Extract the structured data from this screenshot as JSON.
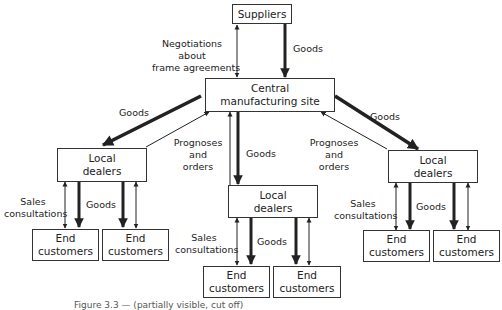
{
  "diagram": {
    "nodes": {
      "suppliers": "Suppliers",
      "central": [
        "Central",
        "manufacturing site"
      ],
      "dealer_left": [
        "Local",
        "dealers"
      ],
      "dealer_mid": [
        "Local",
        "dealers"
      ],
      "dealer_right": [
        "Local",
        "dealers"
      ],
      "end_customers": [
        "End",
        "customers"
      ]
    },
    "edge_labels": {
      "negotiations": [
        "Negotiations",
        "about",
        "frame agreements"
      ],
      "goods": "Goods",
      "prognoses": [
        "Prognoses",
        "and",
        "orders"
      ],
      "sales": [
        "Sales",
        "consultations"
      ]
    },
    "colors": {
      "line": "#222222",
      "box_border": "#333333",
      "background": "#ffffff"
    }
  },
  "caption": "Figure 3.3 — (partially visible, cut off)"
}
